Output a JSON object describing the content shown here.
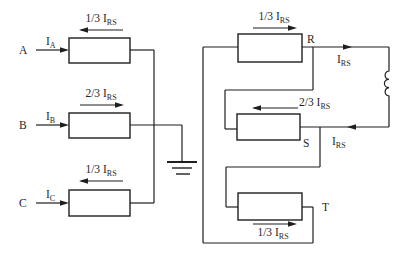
{
  "colors": {
    "line": "#1f1f1f",
    "background": "#ffffff"
  },
  "left_circuit": {
    "windings": [
      {
        "phase": "A",
        "input": {
          "base": "I",
          "sub": "A"
        },
        "share": {
          "base": "1/3 I",
          "sub": "RS"
        },
        "share_arrow_direction": "left"
      },
      {
        "phase": "B",
        "input": {
          "base": "I",
          "sub": "B"
        },
        "share": {
          "base": "2/3 I",
          "sub": "RS"
        },
        "share_arrow_direction": "right"
      },
      {
        "phase": "C",
        "input": {
          "base": "I",
          "sub": "C"
        },
        "share": {
          "base": "1/3 I",
          "sub": "RS"
        },
        "share_arrow_direction": "left"
      }
    ]
  },
  "right_circuit": {
    "windings": [
      {
        "terminal": "R",
        "share": {
          "base": "1/3 I",
          "sub": "RS"
        },
        "share_arrow_direction": "right"
      },
      {
        "terminal": "S",
        "share": {
          "base": "2/3 I",
          "sub": "RS"
        },
        "share_arrow_direction": "left"
      },
      {
        "terminal": "T",
        "share": {
          "base": "1/3 I",
          "sub": "RS"
        },
        "share_arrow_direction": "right"
      }
    ],
    "loop_current_top": {
      "base": "I",
      "sub": "RS"
    },
    "loop_current_return": {
      "base": "I",
      "sub": "RS"
    }
  }
}
